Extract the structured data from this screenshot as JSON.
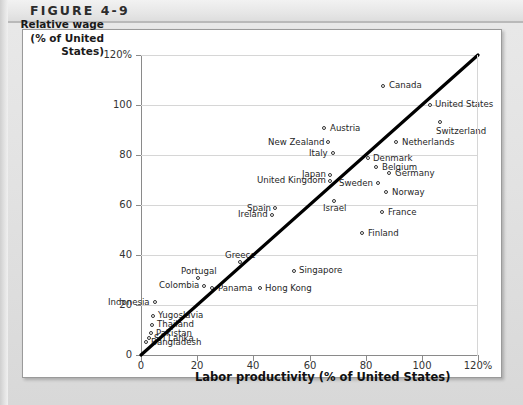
{
  "figure": {
    "label": "FIGURE 4-9"
  },
  "chart_data": {
    "type": "scatter",
    "title": "FIGURE 4-9",
    "xlabel": "Labor productivity (% of United States)",
    "ylabel_lines": [
      "Relative wage",
      "(% of United",
      "States)"
    ],
    "ylabel": "Relative wage (% of United States)",
    "xlim": [
      0,
      120
    ],
    "ylim": [
      0,
      120
    ],
    "xticks": [
      "0",
      "20",
      "40",
      "60",
      "80",
      "100",
      "120%"
    ],
    "xtick_values": [
      0,
      20,
      40,
      60,
      80,
      100,
      120
    ],
    "yticks": [
      "0",
      "20",
      "40",
      "60",
      "80",
      "100",
      "120%"
    ],
    "ytick_values": [
      0,
      20,
      40,
      60,
      80,
      100,
      120
    ],
    "grid": "horizontal",
    "legend": "none",
    "reference_line": {
      "name": "45-degree line",
      "from": [
        0,
        0
      ],
      "to": [
        120,
        120
      ],
      "color": "#000000"
    },
    "points": [
      {
        "label": "Canada",
        "x": 86.5,
        "y": 107.6,
        "label_pos": "right"
      },
      {
        "label": "United States",
        "x": 103.0,
        "y": 100.0,
        "label_pos": "right"
      },
      {
        "label": "Switzerland",
        "x": 106.5,
        "y": 93.0,
        "label_pos": "below-right"
      },
      {
        "label": "Austria",
        "x": 65.5,
        "y": 90.5,
        "label_pos": "right"
      },
      {
        "label": "Netherlands",
        "x": 91.0,
        "y": 85.0,
        "label_pos": "right"
      },
      {
        "label": "New Zealand",
        "x": 66.8,
        "y": 85.0,
        "label_pos": "left"
      },
      {
        "label": "Italy",
        "x": 68.5,
        "y": 80.5,
        "label_pos": "left"
      },
      {
        "label": "Denmark",
        "x": 81.0,
        "y": 78.5,
        "label_pos": "right"
      },
      {
        "label": "Belgium",
        "x": 84.0,
        "y": 75.0,
        "label_pos": "right"
      },
      {
        "label": "Germany",
        "x": 88.5,
        "y": 72.5,
        "label_pos": "right"
      },
      {
        "label": "Japan",
        "x": 67.5,
        "y": 72.0,
        "label_pos": "left"
      },
      {
        "label": "United Kingdom",
        "x": 67.5,
        "y": 69.5,
        "label_pos": "left"
      },
      {
        "label": "Sweden",
        "x": 84.5,
        "y": 68.5,
        "label_pos": "left"
      },
      {
        "label": "Norway",
        "x": 87.5,
        "y": 65.0,
        "label_pos": "right"
      },
      {
        "label": "Spain",
        "x": 48.0,
        "y": 58.5,
        "label_pos": "left"
      },
      {
        "label": "Ireland",
        "x": 47.0,
        "y": 56.0,
        "label_pos": "left"
      },
      {
        "label": "Israel",
        "x": 69.0,
        "y": 61.5,
        "label_pos": "below"
      },
      {
        "label": "France",
        "x": 86.0,
        "y": 57.0,
        "label_pos": "right"
      },
      {
        "label": "Finland",
        "x": 79.0,
        "y": 48.5,
        "label_pos": "right"
      },
      {
        "label": "Greece",
        "x": 35.5,
        "y": 37.0,
        "label_pos": "above"
      },
      {
        "label": "Singapore",
        "x": 54.5,
        "y": 33.5,
        "label_pos": "right"
      },
      {
        "label": "Portugal",
        "x": 20.5,
        "y": 30.5,
        "label_pos": "above"
      },
      {
        "label": "Colombia",
        "x": 22.5,
        "y": 27.5,
        "label_pos": "left"
      },
      {
        "label": "Panama",
        "x": 25.5,
        "y": 26.5,
        "label_pos": "right"
      },
      {
        "label": "Hong Kong",
        "x": 42.5,
        "y": 26.5,
        "label_pos": "right"
      },
      {
        "label": "Indonesia",
        "x": 5.0,
        "y": 21.0,
        "label_pos": "left"
      },
      {
        "label": "Yugoslavia",
        "x": 4.3,
        "y": 15.5,
        "label_pos": "right"
      },
      {
        "label": "Thailand",
        "x": 4.0,
        "y": 12.0,
        "label_pos": "right"
      },
      {
        "label": "Pakistan",
        "x": 3.6,
        "y": 8.5,
        "label_pos": "right"
      },
      {
        "label": "Sri Lanka",
        "x": 2.9,
        "y": 6.5,
        "label_pos": "right"
      },
      {
        "label": "Bangladesh",
        "x": 1.8,
        "y": 5.0,
        "label_pos": "right"
      }
    ]
  }
}
